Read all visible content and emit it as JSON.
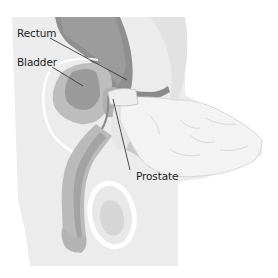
{
  "diagram": {
    "labels": {
      "rectum": "Rectum",
      "bladder": "Bladder",
      "prostate": "Prostate"
    },
    "colors": {
      "background": "#ffffff",
      "body": "#ededed",
      "tissue_light": "#dcdcdc",
      "tissue_mid": "#bcbcbc",
      "tissue_dark": "#9a9a9a",
      "hand": "#f2f2f2",
      "leader_line": "#3a3a3a"
    }
  }
}
